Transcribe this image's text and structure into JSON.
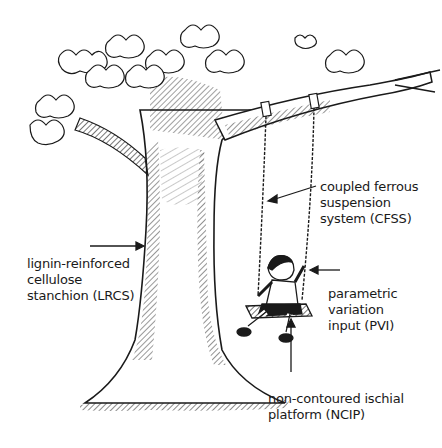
{
  "diagram": {
    "type": "annotated-illustration",
    "labels": [
      {
        "id": "cfss",
        "lines": [
          "coupled ferrous",
          "suspension",
          "system (CFSS)"
        ],
        "points_to": "swing chains"
      },
      {
        "id": "lrcs",
        "lines": [
          "lignin-reinforced",
          "cellulose",
          "stanchion (LRCS)"
        ],
        "points_to": "tree trunk"
      },
      {
        "id": "pvi",
        "lines": [
          "parametric",
          "variation",
          "input (PVI)"
        ],
        "points_to": "child on swing"
      },
      {
        "id": "ncip",
        "lines": [
          "non-contoured ischial",
          "platform (NCIP)"
        ],
        "points_to": "swing seat"
      }
    ]
  },
  "colors": {
    "ink": "#1a1a1a",
    "background": "#ffffff"
  }
}
